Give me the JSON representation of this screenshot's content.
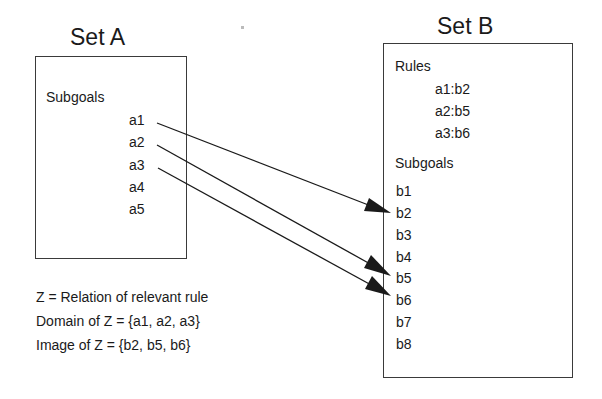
{
  "set_a": {
    "title": "Set A",
    "section_label": "Subgoals",
    "subgoals": [
      "a1",
      "a2",
      "a3",
      "a4",
      "a5"
    ]
  },
  "set_b": {
    "title": "Set B",
    "rules_label": "Rules",
    "rules": [
      "a1:b2",
      "a2:b5",
      "a3:b6"
    ],
    "section_label": "Subgoals",
    "subgoals": [
      "b1",
      "b2",
      "b3",
      "b4",
      "b5",
      "b6",
      "b7",
      "b8"
    ]
  },
  "mappings": [
    {
      "from": "a1",
      "to": "b2"
    },
    {
      "from": "a2",
      "to": "b5"
    },
    {
      "from": "a3",
      "to": "b6"
    }
  ],
  "notes": [
    "Z = Relation of relevant rule",
    "Domain of Z = {a1, a2, a3}",
    "Image of Z = {b2, b5, b6}"
  ],
  "colors": {
    "line": "#1a1a1a",
    "box_border": "#3a3a3a"
  }
}
